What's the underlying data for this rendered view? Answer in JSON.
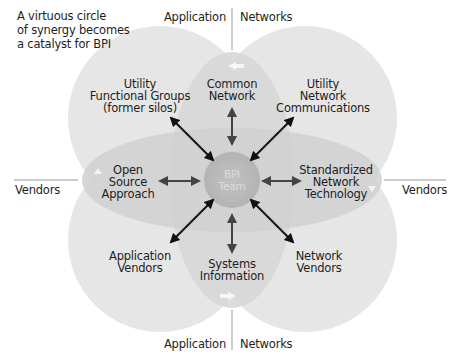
{
  "caption": "A virtuous circle\nof synergy becomes\na catalyst for BPI",
  "axes": {
    "top_left": "Application",
    "top_right": "Networks",
    "bottom_left": "Application",
    "bottom_right": "Networks",
    "left": "Vendors",
    "right": "Vendors"
  },
  "center": {
    "label": "BPI\nTeam"
  },
  "nodes": {
    "top_left": "Utility\nFunctional Groups\n(former silos)",
    "top": "Common\nNetwork",
    "top_right": "Utility\nNetwork\nCommunications",
    "left": "Open\nSource\nApproach",
    "right": "Standardized\nNetwork\nTechnology",
    "bottom_left": "Application\nVendors",
    "bottom": "Systems\nInformation",
    "bottom_right": "Network\nVendors"
  },
  "colors": {
    "petal_light": "#e4e4e4",
    "petal_mid": "#cfcfcf",
    "center": "#b9b9b9",
    "arrow": "#111111",
    "arrow_gray": "#444444"
  }
}
